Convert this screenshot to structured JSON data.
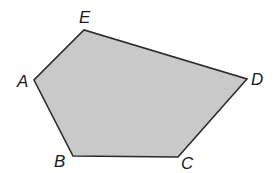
{
  "figure": {
    "shape": "pentagon",
    "fill_color": "#c9c9c9",
    "stroke_color": "#2a2a2a",
    "vertices": [
      {
        "label": "A",
        "x": 34,
        "y": 80,
        "label_x": 17,
        "label_y": 87
      },
      {
        "label": "B",
        "x": 73,
        "y": 156,
        "label_x": 54,
        "label_y": 167
      },
      {
        "label": "C",
        "x": 178,
        "y": 157,
        "label_x": 181,
        "label_y": 169
      },
      {
        "label": "D",
        "x": 247,
        "y": 79,
        "label_x": 251,
        "label_y": 85
      },
      {
        "label": "E",
        "x": 84,
        "y": 30,
        "label_x": 79,
        "label_y": 23
      }
    ]
  }
}
